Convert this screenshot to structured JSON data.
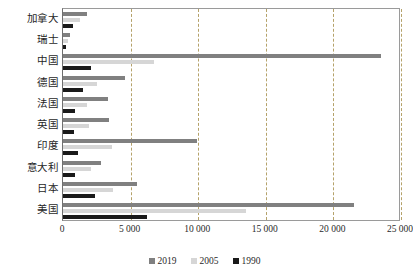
{
  "chart_data": {
    "type": "bar",
    "orientation": "horizontal",
    "title": "",
    "subtitle": "",
    "xlabel": "",
    "ylabel": "",
    "xlim": [
      0,
      25000
    ],
    "grid": true,
    "grid_style": "dashed-vertical",
    "legend_position": "bottom-center",
    "xticks": [
      0,
      5000,
      10000,
      15000,
      20000,
      25000
    ],
    "xtick_labels": [
      "0",
      "5 000",
      "10 000",
      "15 000",
      "20 000",
      "25 000"
    ],
    "categories": [
      "加拿大",
      "瑞士",
      "中国",
      "德国",
      "法国",
      "英国",
      "印度",
      "意大利",
      "日本",
      "美国"
    ],
    "series": [
      {
        "name": "2019",
        "color": "#808080",
        "values": [
          1750,
          520,
          23500,
          4600,
          3300,
          3400,
          9900,
          2800,
          5500,
          21500
        ]
      },
      {
        "name": "2005",
        "color": "#d6d6d6",
        "values": [
          1250,
          380,
          6700,
          2500,
          1750,
          1900,
          3600,
          2100,
          3700,
          13500
        ]
      },
      {
        "name": "1990",
        "color": "#1a1a1a",
        "values": [
          750,
          200,
          2100,
          1500,
          900,
          850,
          1100,
          900,
          2400,
          6200
        ]
      }
    ]
  },
  "legend": {
    "items": [
      {
        "label": "2019",
        "color": "#808080"
      },
      {
        "label": "2005",
        "color": "#d6d6d6"
      },
      {
        "label": "1990",
        "color": "#1a1a1a"
      }
    ]
  },
  "colors": {
    "series_2019": "#808080",
    "series_2005": "#d6d6d6",
    "series_1990": "#1a1a1a",
    "gridline": "#b5a26a",
    "frame": "#9a9a9a",
    "background": "#ffffff"
  }
}
